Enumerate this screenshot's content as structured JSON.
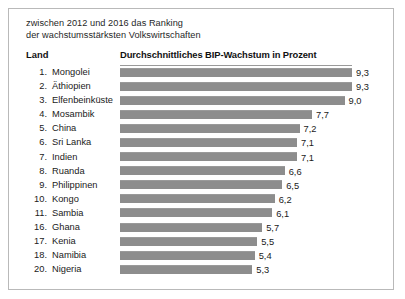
{
  "card": {
    "title": "zwischen 2012 und 2016 das Ranking\nder wachstumsstärksten Volkswirtschaften",
    "border_color": "#b9b9b9"
  },
  "columns": {
    "country_header": "Land",
    "value_header": "Durchschnittliches BIP-Wachstum in Prozent"
  },
  "style": {
    "bar_color": "#8d8d8d",
    "rule_color": "#9a9a9a",
    "text_color": "#1a1a1a"
  },
  "chart_data": {
    "type": "bar",
    "orientation": "horizontal",
    "title": "zwischen 2012 und 2016 das Ranking der wachstumsstärksten Volkswirtschaften",
    "xlabel": "Durchschnittliches BIP-Wachstum in Prozent",
    "ylabel": "Land",
    "grid": false,
    "legend": "none",
    "xlim": [
      0,
      9.3
    ],
    "value_format": "de-DE decimal comma, one decimal",
    "categories": [
      "Mongolei",
      "Äthiopien",
      "Elfenbeinküste",
      "Mosambik",
      "China",
      "Sri Lanka",
      "Indien",
      "Ruanda",
      "Philippinen",
      "Kongo",
      "Sambia",
      "Ghana",
      "Kenia",
      "Namibia",
      "Nigeria"
    ],
    "ranks": [
      1,
      2,
      3,
      4,
      5,
      6,
      7,
      8,
      9,
      10,
      11,
      16,
      17,
      18,
      20
    ],
    "values": [
      9.3,
      9.3,
      9.0,
      7.7,
      7.2,
      7.1,
      7.1,
      6.6,
      6.5,
      6.2,
      6.1,
      5.7,
      5.5,
      5.4,
      5.3
    ],
    "value_labels": [
      "9,3",
      "9,3",
      "9,0",
      "7,7",
      "7,2",
      "7,1",
      "7,1",
      "6,6",
      "6,5",
      "6,2",
      "6,1",
      "5,7",
      "5,5",
      "5,4",
      "5,3"
    ]
  },
  "rows": [
    {
      "rank": "1.",
      "country": "Mongolei",
      "value": 9.3,
      "label": "9,3"
    },
    {
      "rank": "2.",
      "country": "Äthiopien",
      "value": 9.3,
      "label": "9,3"
    },
    {
      "rank": "3.",
      "country": "Elfenbeinküste",
      "value": 9.0,
      "label": "9,0"
    },
    {
      "rank": "4.",
      "country": "Mosambik",
      "value": 7.7,
      "label": "7,7"
    },
    {
      "rank": "5.",
      "country": "China",
      "value": 7.2,
      "label": "7,2"
    },
    {
      "rank": "6.",
      "country": "Sri Lanka",
      "value": 7.1,
      "label": "7,1"
    },
    {
      "rank": "7.",
      "country": "Indien",
      "value": 7.1,
      "label": "7,1"
    },
    {
      "rank": "8.",
      "country": "Ruanda",
      "value": 6.6,
      "label": "6,6"
    },
    {
      "rank": "9.",
      "country": "Philippinen",
      "value": 6.5,
      "label": "6,5"
    },
    {
      "rank": "10.",
      "country": "Kongo",
      "value": 6.2,
      "label": "6,2"
    },
    {
      "rank": "11.",
      "country": "Sambia",
      "value": 6.1,
      "label": "6,1"
    },
    {
      "rank": "16.",
      "country": "Ghana",
      "value": 5.7,
      "label": "5,7"
    },
    {
      "rank": "17.",
      "country": "Kenia",
      "value": 5.5,
      "label": "5,5"
    },
    {
      "rank": "18.",
      "country": "Namibia",
      "value": 5.4,
      "label": "5,4"
    },
    {
      "rank": "20.",
      "country": "Nigeria",
      "value": 5.3,
      "label": "5,3"
    }
  ]
}
